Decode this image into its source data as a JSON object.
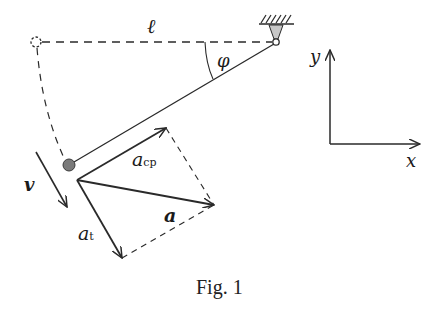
{
  "figure": {
    "caption": "Fig. 1",
    "labels": {
      "length": "ℓ",
      "angle": "φ",
      "velocity": "v",
      "centripetal_acc": "a",
      "centripetal_sub": "cp",
      "total_acc": "a",
      "tangential_acc": "a",
      "tangential_sub": "t",
      "y_axis": "y",
      "x_axis": "x"
    },
    "colors": {
      "stroke": "#2a2a2a",
      "bob_fill": "#7a7a7a",
      "support_fill": "#c8c8c8",
      "background": "#ffffff"
    },
    "elements": {
      "pivot": {
        "x": 276,
        "y": 42
      },
      "initial_position": {
        "x": 36,
        "y": 42
      },
      "bob": {
        "x": 69,
        "y": 165,
        "r": 6
      },
      "acc_origin": {
        "x": 77,
        "y": 180
      },
      "a_cp_tip": {
        "x": 166,
        "y": 128
      },
      "a_tip": {
        "x": 214,
        "y": 205
      },
      "a_t_tip": {
        "x": 122,
        "y": 258
      },
      "axes_origin": {
        "x": 330,
        "y": 144
      }
    }
  }
}
